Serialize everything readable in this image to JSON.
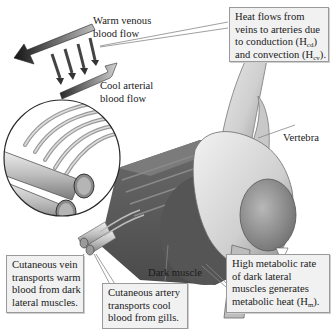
{
  "diagram": {
    "labels": {
      "warm_flow": [
        "Warm venous",
        "blood flow"
      ],
      "cool_flow": [
        "Cool arterial",
        "blood flow"
      ],
      "vertebra": "Vertebra",
      "dark_muscle": "Dark muscle"
    },
    "callouts": {
      "heat_flow": {
        "lines": [
          "Heat flows from",
          "veins to arteries due",
          "to conduction (H",
          ") and convection (H",
          ")."
        ],
        "sub1": "cd",
        "sub2": "cv",
        "l1": "Heat flows from",
        "l2": "veins to arteries due",
        "l3a": "to conduction (H",
        "l3b": ")",
        "l4a": "and convection (H",
        "l4b": ")."
      },
      "cutaneous_vein": {
        "l1": "Cutaneous vein",
        "l2": "transports warm",
        "l3": "blood from dark",
        "l4": "lateral muscles."
      },
      "cutaneous_artery": {
        "l1": "Cutaneous artery",
        "l2": "transports cool",
        "l3": "blood from gills."
      },
      "metabolic": {
        "l1": "High metabolic rate",
        "l2": "of dark lateral",
        "l3": "muscles generates",
        "l4a": "metabolic heat (H",
        "sub": "m",
        "l4b": ")."
      }
    },
    "colors": {
      "callout_bg": "#f1f1f1",
      "callout_border": "#9a9a9a",
      "muscle": "#5a5a5a",
      "bone": "#d6d6d6",
      "arrow_dark": "#2a2a2a"
    }
  }
}
